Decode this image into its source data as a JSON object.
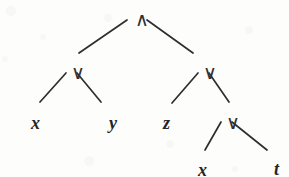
{
  "figure": {
    "name": "binary-expression-tree",
    "background_color": "#fdfdfc",
    "ink_color": "#2e2e30",
    "width": 289,
    "height": 177
  },
  "nodes": [
    {
      "id": "n0",
      "label": "∧",
      "kind": "operator",
      "name": "and",
      "x": 135,
      "y": 10,
      "level": 0
    },
    {
      "id": "n1",
      "label": "∨",
      "kind": "operator",
      "name": "or",
      "x": 71,
      "y": 63,
      "level": 1
    },
    {
      "id": "n2",
      "label": "∨",
      "kind": "operator",
      "name": "or",
      "x": 203,
      "y": 63,
      "level": 1
    },
    {
      "id": "n3",
      "label": "x",
      "kind": "variable",
      "name": "x",
      "x": 31,
      "y": 114,
      "level": 2
    },
    {
      "id": "n4",
      "label": "y",
      "kind": "variable",
      "name": "y",
      "x": 109,
      "y": 114,
      "level": 2
    },
    {
      "id": "n5",
      "label": "z",
      "kind": "variable",
      "name": "z",
      "x": 163,
      "y": 114,
      "level": 2
    },
    {
      "id": "n6",
      "label": "∨",
      "kind": "operator",
      "name": "or",
      "x": 226,
      "y": 113,
      "level": 2
    },
    {
      "id": "n7",
      "label": "x",
      "kind": "variable",
      "name": "x",
      "x": 198,
      "y": 161,
      "level": 3
    },
    {
      "id": "n8",
      "label": "t",
      "kind": "variable",
      "name": "t",
      "x": 274,
      "y": 160,
      "level": 3
    }
  ],
  "edges": [
    {
      "from": "n0",
      "to": "n1",
      "x1": 127,
      "y1": 20,
      "x2": 79,
      "y2": 53
    },
    {
      "from": "n0",
      "to": "n2",
      "x1": 147,
      "y1": 20,
      "x2": 193,
      "y2": 53
    },
    {
      "from": "n1",
      "to": "n3",
      "x1": 66,
      "y1": 73,
      "x2": 40,
      "y2": 102
    },
    {
      "from": "n1",
      "to": "n4",
      "x1": 77,
      "y1": 73,
      "x2": 101,
      "y2": 102
    },
    {
      "from": "n2",
      "to": "n5",
      "x1": 198,
      "y1": 73,
      "x2": 172,
      "y2": 103
    },
    {
      "from": "n2",
      "to": "n6",
      "x1": 209,
      "y1": 73,
      "x2": 229,
      "y2": 102
    },
    {
      "from": "n6",
      "to": "n7",
      "x1": 221,
      "y1": 122,
      "x2": 205,
      "y2": 150
    },
    {
      "from": "n6",
      "to": "n8",
      "x1": 232,
      "y1": 122,
      "x2": 267,
      "y2": 150
    }
  ],
  "speckles": [
    {
      "x": 6,
      "y": 6,
      "r": 5
    },
    {
      "x": 40,
      "y": 34,
      "r": 3
    },
    {
      "x": 104,
      "y": 14,
      "r": 4
    },
    {
      "x": 2,
      "y": 56,
      "r": 3
    },
    {
      "x": 245,
      "y": 26,
      "r": 4
    },
    {
      "x": 166,
      "y": 140,
      "r": 4
    },
    {
      "x": 84,
      "y": 156,
      "r": 5
    },
    {
      "x": 232,
      "y": 166,
      "r": 3
    }
  ]
}
